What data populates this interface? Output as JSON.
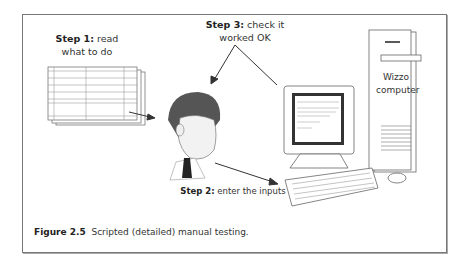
{
  "figure": {
    "caption_number": "Figure 2.5",
    "caption_text": "Scripted (detailed) manual testing."
  },
  "steps": [
    {
      "label": "Step 1:",
      "text_line1": "read",
      "text_line2": "what to do"
    },
    {
      "label": "Step 2:",
      "text": "enter the inputs"
    },
    {
      "label": "Step 3:",
      "text_line1": "check it",
      "text_line2": "worked OK"
    }
  ],
  "computer": {
    "line1": "Wizzo",
    "line2": "computer"
  },
  "illustrations": [
    "test-script-pages",
    "tester-person",
    "monitor",
    "keyboard",
    "mouse",
    "tower-computer"
  ],
  "colors": {
    "border": "#777777",
    "text": "#333333",
    "hair": "#555555",
    "tie": "#222222"
  }
}
